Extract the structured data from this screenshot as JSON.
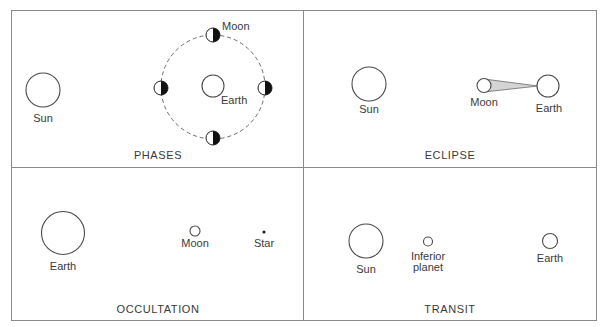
{
  "colors": {
    "line": "#4a4a4a",
    "frame": "#8a8a8a",
    "shadow_fill": "#d4d4d4",
    "dark_half": "#111111",
    "text": "#3a3a3a"
  },
  "panels": {
    "phases": {
      "title": "PHASES",
      "sun_label": "Sun",
      "earth_label": "Earth",
      "moon_label": "Moon",
      "moon_positions": [
        "top",
        "left",
        "right",
        "bottom"
      ]
    },
    "eclipse": {
      "title": "ECLIPSE",
      "sun_label": "Sun",
      "moon_label": "Moon",
      "earth_label": "Earth"
    },
    "occultation": {
      "title": "OCCULTATION",
      "earth_label": "Earth",
      "moon_label": "Moon",
      "star_label": "Star"
    },
    "transit": {
      "title": "TRANSIT",
      "sun_label": "Sun",
      "planet_label_line1": "Inferior",
      "planet_label_line2": "planet",
      "earth_label": "Earth"
    }
  }
}
